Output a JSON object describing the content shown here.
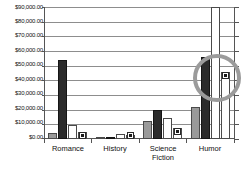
{
  "chart_data": {
    "type": "bar",
    "title": "",
    "xlabel": "",
    "ylabel": "",
    "ylim": [
      0,
      90000
    ],
    "ytick_step": 10000,
    "grid": true,
    "legend": "none",
    "categories": [
      "Romance",
      "History",
      "Science\nFiction",
      "Humor"
    ],
    "ytick_labels": [
      "$90,000.00",
      "$80,000.00",
      "$70,000.00",
      "$60,000.00",
      "$50,000.00",
      "$40,000.00",
      "$30,000.00",
      "$20,000.00",
      "$10,000.00",
      "$0.00"
    ],
    "series": [
      {
        "name": "series-1",
        "values": [
          4000,
          500,
          12000,
          22000
        ]
      },
      {
        "name": "series-2",
        "values": [
          54000,
          1000,
          20000,
          56000
        ]
      },
      {
        "name": "series-3",
        "values": [
          9500,
          3500,
          14000,
          90000
        ]
      },
      {
        "name": "series-4",
        "values": [
          4500,
          3000,
          7500,
          45500
        ]
      }
    ],
    "marker_series": "series-4",
    "annotations": [
      {
        "type": "ellipse-highlight",
        "target": "humor-series-4-marker",
        "value": 45500,
        "color": "#9b9b9b"
      }
    ]
  }
}
